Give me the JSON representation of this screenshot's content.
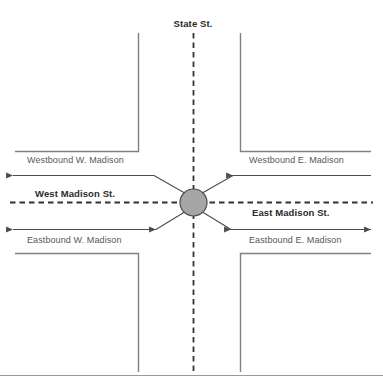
{
  "diagram": {
    "center_node": {
      "name": "intersection-node",
      "fill": "#a6a6a6",
      "stroke": "#4d4d4d",
      "cx": 193.5,
      "cy": 202.5,
      "r": 13.5
    },
    "colors": {
      "curb_line": "#808080",
      "dashed_center": "#333333",
      "arrow": "#4d4d4d",
      "street_label": "#2b2b2b",
      "approach_label": "#585858",
      "frame_rule": "#9a9a9a"
    },
    "streets": {
      "north": "State St.",
      "west": "West Madison St.",
      "east": "East Madison St."
    },
    "approaches": {
      "westbound_west": "Westbound W. Madison",
      "westbound_east": "Westbound E. Madison",
      "eastbound_west": "Eastbound W. Madison",
      "eastbound_east": "Eastbound E. Madison"
    }
  }
}
